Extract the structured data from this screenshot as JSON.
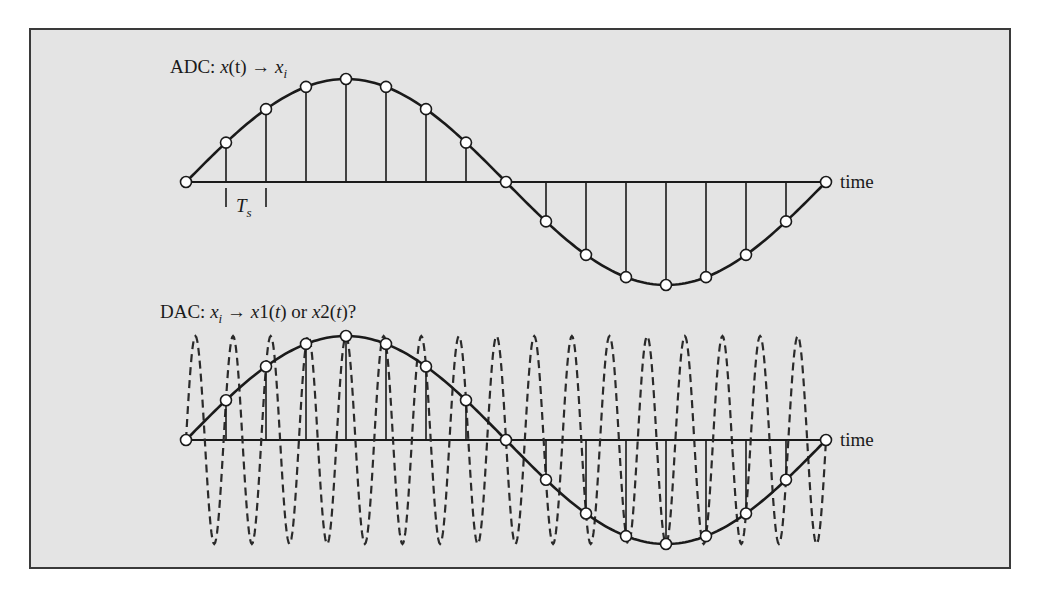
{
  "figure": {
    "panel_background": "#e4e4e4",
    "border_color": "#3a3a3a",
    "ink_color": "#1a1a1a",
    "marker_fill": "#ffffff",
    "samples_per_period": 16,
    "sample_period_label": "T",
    "sample_period_subscript": "s"
  },
  "adc": {
    "label_prefix": "ADC: ",
    "label_signal": "x",
    "label_arg": "(t)",
    "label_arrow": " → ",
    "label_sample": "x",
    "label_sample_subscript": "i",
    "axis_label": "time",
    "geometry": {
      "x0": 186,
      "x1": 826,
      "axis_y": 182,
      "amplitude": 103
    }
  },
  "dac": {
    "label_prefix": "DAC: ",
    "label_sample": "x",
    "label_sample_subscript": "i",
    "label_arrow": " → ",
    "label_option1": "x",
    "label_option1_rest": "1(",
    "label_option1_arg": "t",
    "label_or": ") or ",
    "label_option2": "x",
    "label_option2_rest": "2(",
    "label_option2_arg": "t",
    "label_end": ")?",
    "axis_label": "time",
    "geometry": {
      "x0": 186,
      "x1": 826,
      "axis_y": 440,
      "amplitude": 104
    },
    "alias_cycles": 17
  },
  "chart_data": {
    "type": "line",
    "xlabel": "time",
    "ylabel": "",
    "series": [
      {
        "name": "x(t) / x1(t)",
        "style": "solid",
        "description": "one period of a sine wave",
        "cycles": 1
      },
      {
        "name": "x2(t)",
        "style": "dashed",
        "description": "high-frequency alias passing through the same samples",
        "cycles": 17
      },
      {
        "name": "x_i samples",
        "style": "stems with open circle markers",
        "count": 17,
        "values": [
          0,
          0.383,
          0.707,
          0.924,
          1,
          0.924,
          0.707,
          0.383,
          0,
          -0.383,
          -0.707,
          -0.924,
          -1,
          -0.924,
          -0.707,
          -0.383,
          0
        ]
      }
    ],
    "annotations": [
      "T_s (sample interval between 2nd and 3rd samples)"
    ],
    "legend": "none",
    "grid": false
  }
}
